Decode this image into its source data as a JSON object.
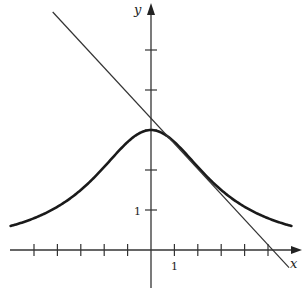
{
  "chart_data": {
    "type": "line",
    "title": "",
    "xlabel": "x",
    "ylabel": "y",
    "xlim": [
      -6.2,
      6.3
    ],
    "ylim": [
      -1,
      6.2
    ],
    "grid": false,
    "x_tick_labels": [
      {
        "value": 1,
        "label": "1"
      }
    ],
    "y_tick_labels": [
      {
        "value": 1,
        "label": "1"
      }
    ],
    "x_ticks": [
      -5,
      -4,
      -3,
      -2,
      -1,
      1,
      2,
      3,
      4,
      5
    ],
    "y_ticks": [
      1,
      2,
      3,
      4,
      5
    ],
    "series": [
      {
        "name": "curve",
        "equation": "y = 27/(9 + x^2)",
        "x": [
          -6,
          -5,
          -4,
          -3,
          -2,
          -1,
          0,
          1,
          2,
          3,
          4,
          5,
          6
        ],
        "values": [
          0.6,
          0.79,
          1.08,
          1.5,
          2.08,
          2.7,
          3.0,
          2.7,
          2.08,
          1.5,
          1.08,
          0.79,
          0.6
        ],
        "stroke_width": 2.6
      },
      {
        "name": "tangent line",
        "description": "tangent to curve at x = 2",
        "slope": -0.64,
        "intercept": 3.36,
        "x": [
          -4.2,
          5.9
        ],
        "values": [
          5.95,
          -0.44
        ],
        "stroke_width": 1.2
      }
    ]
  },
  "labels": {
    "x_axis": "x",
    "y_axis": "y",
    "x_one": "1",
    "y_one": "1"
  },
  "colors": {
    "ink": "#222222",
    "background": "#ffffff"
  }
}
